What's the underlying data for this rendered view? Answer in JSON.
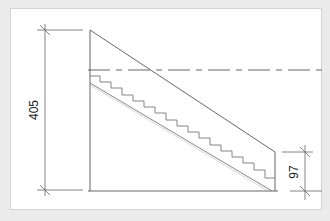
{
  "drawing": {
    "type": "stair-section",
    "dimensions": {
      "total_height_label": "405",
      "bottom_offset_label": "97"
    },
    "colors": {
      "background": "#ebebeb",
      "panel": "#ffffff",
      "line": "#555555",
      "stair_line": "#888888"
    }
  }
}
